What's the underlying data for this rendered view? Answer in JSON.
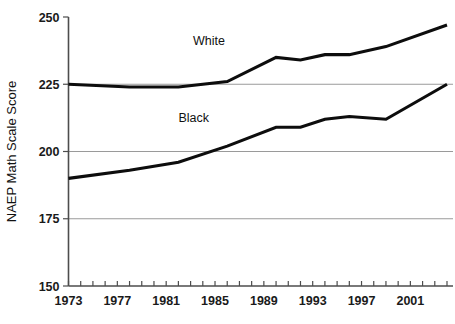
{
  "chart_data": {
    "type": "line",
    "title": "",
    "xlabel": "",
    "ylabel": "NAEP Math Scale Score",
    "ylim": [
      150,
      250
    ],
    "xlim": [
      1973,
      2004
    ],
    "y_ticks": [
      150,
      175,
      200,
      225,
      250
    ],
    "y_tick_labels": [
      "150",
      "175",
      "200",
      "225",
      "250"
    ],
    "x_tick_labels": [
      "1973",
      "1977",
      "1981",
      "1985",
      "1989",
      "1993",
      "1997",
      "2001"
    ],
    "x_tick_values": [
      1973,
      1977,
      1981,
      1985,
      1989,
      1993,
      1997,
      2001
    ],
    "x_minor_ticks_every": 1,
    "grid": "horizontal-only",
    "grid_values": [
      175,
      200,
      225
    ],
    "legend": "inline-labels",
    "series": [
      {
        "name": "White",
        "label": "White",
        "color": "#0d0d0d",
        "x": [
          1973,
          1978,
          1982,
          1986,
          1990,
          1992,
          1994,
          1996,
          1999,
          2004
        ],
        "values": [
          225,
          224,
          224,
          226,
          235,
          234,
          236,
          236,
          239,
          247
        ]
      },
      {
        "name": "Black",
        "label": "Black",
        "color": "#0d0d0d",
        "x": [
          1973,
          1978,
          1982,
          1986,
          1990,
          1992,
          1994,
          1996,
          1999,
          2004
        ],
        "values": [
          190,
          193,
          196,
          202,
          209,
          209,
          212,
          213,
          212,
          225
        ]
      }
    ],
    "annotations": [
      {
        "text": "White",
        "x": 1983.2,
        "y": 239.5
      },
      {
        "text": "Black",
        "x": 1982.0,
        "y": 211.0
      }
    ]
  }
}
